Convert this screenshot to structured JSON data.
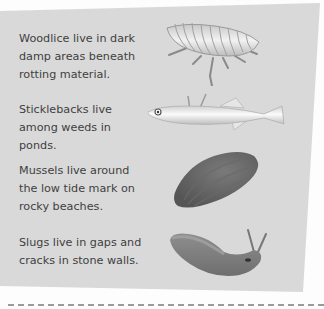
{
  "items": [
    {
      "text": "Woodlice live in dark damp areas beneath rotting material.",
      "icon": "woodlouse-icon"
    },
    {
      "text": "Sticklebacks live among weeds in ponds.",
      "icon": "stickleback-fish-icon"
    },
    {
      "text": "Mussels live around the low tide mark on rocky beaches.",
      "icon": "mussel-shell-icon"
    },
    {
      "text": "Slugs live in gaps and cracks in stone walls.",
      "icon": "slug-icon"
    }
  ]
}
